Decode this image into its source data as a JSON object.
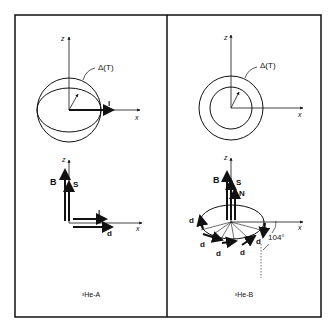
{
  "panels": [
    {
      "id": "A",
      "caption": "³He-A",
      "top": {
        "z_label": "z",
        "x_label": "x",
        "gap_label": "Δ(T)",
        "vector_label": "l"
      },
      "bottom": {
        "z_label": "z",
        "x_label": "x",
        "B_label": "B",
        "S_label": "S",
        "l_label": "l",
        "d_label": "d"
      }
    },
    {
      "id": "B",
      "caption": "³He-B",
      "top": {
        "z_label": "z",
        "x_label": "x",
        "gap_label": "Δ(T)"
      },
      "bottom": {
        "z_label": "z",
        "x_label": "x",
        "B_label": "B",
        "S_label": "S",
        "N_label": "N",
        "d_label": "d",
        "angle_label": "104°"
      }
    }
  ]
}
